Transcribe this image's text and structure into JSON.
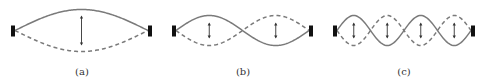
{
  "figure": {
    "colors": {
      "string": "#7a7a7a",
      "clamp": "#111111",
      "arrow": "#333333"
    },
    "panels": [
      {
        "id": "a",
        "label": "(a)",
        "loops": 1
      },
      {
        "id": "b",
        "label": "(b)",
        "loops": 2
      },
      {
        "id": "c",
        "label": "(c)",
        "loops": 4
      }
    ]
  }
}
